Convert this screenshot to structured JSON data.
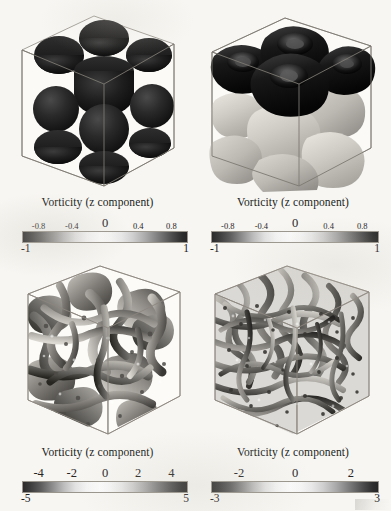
{
  "figure": {
    "type": "volume-rendering-grid",
    "background_color": "#f7f6f2",
    "rows": 2,
    "cols": 2
  },
  "panels": [
    {
      "id": "top-left",
      "caption": "Vorticity (z component)",
      "content_description": "isometric wireframe cube containing a 3x3 arrangement of dark spherical iso-surfaces",
      "colorbar": {
        "min_label": "-1",
        "max_label": "1",
        "min_value": -1,
        "max_value": 1,
        "ticks": [
          "-0.8",
          "-0.4",
          "0",
          "0.4",
          "0.8"
        ],
        "tick_values": [
          -0.8,
          -0.4,
          0,
          0.4,
          0.8
        ],
        "colormap": "diverging-grayscale",
        "colors": [
          "#2b2b2b",
          "#fbfbfb",
          "#262626"
        ]
      }
    },
    {
      "id": "top-right",
      "caption": "Vorticity (z component)",
      "content_description": "isometric wireframe cube with dark rounded-cube iso-surfaces on the upper layer and light grey rounded blobs below",
      "colorbar": {
        "min_label": "-1",
        "max_label": "1",
        "min_value": -1,
        "max_value": 1,
        "ticks": [
          "-0.8",
          "-0.4",
          "0",
          "0.4",
          "0.8"
        ],
        "tick_values": [
          -0.8,
          -0.4,
          0,
          0.4,
          0.8
        ],
        "colormap": "diverging-grayscale",
        "colors": [
          "#2b2b2b",
          "#fbfbfb",
          "#262626"
        ]
      }
    },
    {
      "id": "bottom-left",
      "caption": "Vorticity (z component)",
      "content_description": "isometric wireframe cube filled with dense tangled turbulent vortex iso-surfaces at intermediate scale",
      "colorbar": {
        "min_label": "-5",
        "max_label": "5",
        "min_value": -5,
        "max_value": 5,
        "ticks": [
          "-4",
          "-2",
          "0",
          "2",
          "4"
        ],
        "tick_values": [
          -4,
          -2,
          0,
          2,
          4
        ],
        "colormap": "diverging-grayscale",
        "colors": [
          "#2b2b2b",
          "#fbfbfb",
          "#262626"
        ]
      }
    },
    {
      "id": "bottom-right",
      "caption": "Vorticity (z component)",
      "content_description": "isometric wireframe cube completely filled with fine-scale fully developed turbulent vortex iso-surfaces",
      "colorbar": {
        "min_label": "-3",
        "max_label": "3",
        "min_value": -3,
        "max_value": 3,
        "ticks": [
          "-2",
          "0",
          "2"
        ],
        "tick_values": [
          -2,
          0,
          2
        ],
        "colormap": "diverging-grayscale",
        "colors": [
          "#2b2b2b",
          "#fbfbfb",
          "#262626"
        ]
      }
    }
  ]
}
